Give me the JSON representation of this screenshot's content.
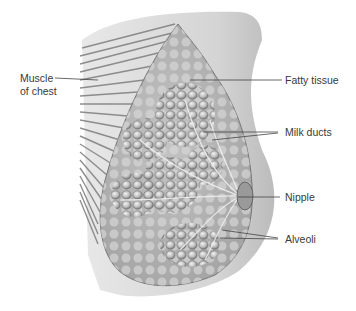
{
  "figure": {
    "type": "anatomical-illustration",
    "labels": {
      "muscle": [
        "Muscle",
        "of chest"
      ],
      "fatty_tissue": "Fatty tissue",
      "milk_ducts": "Milk ducts",
      "nipple": "Nipple",
      "alveoli": "Alveoli"
    }
  }
}
